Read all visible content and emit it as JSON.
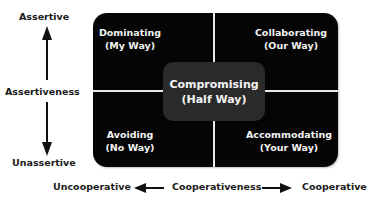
{
  "vertical_axis": {
    "top_label": "Assertive",
    "middle_label": "Assertiveness",
    "bottom_label": "Unassertive"
  },
  "horizontal_axis": {
    "left_label": "Uncooperative",
    "middle_label": "Cooperativeness",
    "right_label": "Cooperative"
  },
  "quadrants": {
    "top_left": {
      "title": "Dominating",
      "subtitle": "(My Way)"
    },
    "top_right": {
      "title": "Collaborating",
      "subtitle": "(Our Way)"
    },
    "bottom_left": {
      "title": "Avoiding",
      "subtitle": "(No Way)"
    },
    "bottom_right": {
      "title": "Accommodating",
      "subtitle": "(Your Way)"
    },
    "center": {
      "title": "Compromising",
      "subtitle": "(Half Way)"
    }
  }
}
